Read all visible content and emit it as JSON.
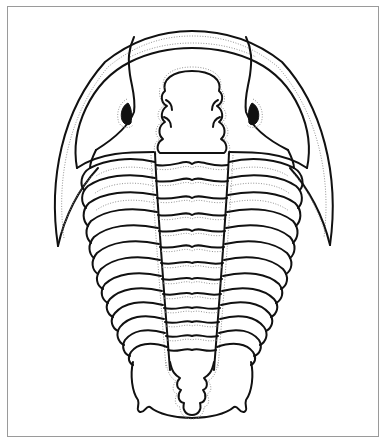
{
  "figure": {
    "view": "dorsal",
    "style": "black line drawing with dotted inner margins",
    "parts": {
      "cephalon": "head shield with border, facial sutures and genal spines",
      "glabella": "lobed central head region",
      "eyes": "two black crescent eyes",
      "thorax_segments": 13,
      "pygidium": "tail shield with spines"
    },
    "colors": {
      "line": "#111111",
      "dotted": "#888888",
      "frame": "#9a9a9a",
      "background": "#ffffff"
    }
  }
}
